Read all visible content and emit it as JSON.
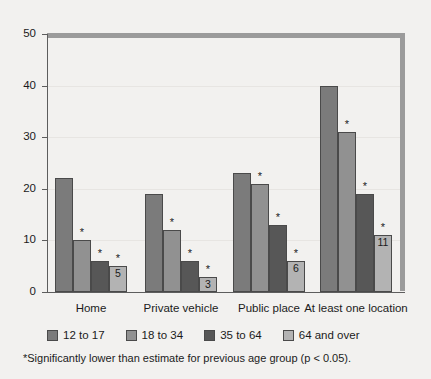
{
  "chart_data": {
    "type": "bar",
    "title": "",
    "subtitle": "",
    "xlabel": "",
    "ylabel": "",
    "ylim": [
      0,
      50
    ],
    "yticks": [
      0,
      10,
      20,
      30,
      40,
      50
    ],
    "ytick_labels": [
      "0",
      "10",
      "20",
      "30",
      "40",
      "50"
    ],
    "grid": true,
    "legend_position": "bottom",
    "categories": [
      "Home",
      "Private vehicle",
      "Public place",
      "At least one location"
    ],
    "series": [
      {
        "name": "12 to 17",
        "color": "#7b7b7b",
        "values": [
          22,
          19,
          23,
          40
        ]
      },
      {
        "name": "18 to 34",
        "color": "#919191",
        "values": [
          10,
          12,
          21,
          31
        ]
      },
      {
        "name": "35 to 64",
        "color": "#575757",
        "values": [
          6,
          6,
          13,
          19
        ]
      },
      {
        "name": "64 and over",
        "color": "#b3b3b3",
        "values": [
          5,
          3,
          6,
          11
        ]
      }
    ],
    "significance_markers": [
      {
        "category": "Home",
        "series": "18 to 34",
        "marker": "*"
      },
      {
        "category": "Home",
        "series": "35 to 64",
        "marker": "*"
      },
      {
        "category": "Home",
        "series": "64 and over",
        "marker": "*"
      },
      {
        "category": "Private vehicle",
        "series": "18 to 34",
        "marker": "*"
      },
      {
        "category": "Private vehicle",
        "series": "35 to 64",
        "marker": "*"
      },
      {
        "category": "Private vehicle",
        "series": "64 and over",
        "marker": "*"
      },
      {
        "category": "Public place",
        "series": "18 to 34",
        "marker": "*"
      },
      {
        "category": "Public place",
        "series": "35 to 64",
        "marker": "*"
      },
      {
        "category": "Public place",
        "series": "64 and over",
        "marker": "*"
      },
      {
        "category": "At least one location",
        "series": "18 to 34",
        "marker": "*"
      },
      {
        "category": "At least one location",
        "series": "35 to 64",
        "marker": "*"
      },
      {
        "category": "At least one location",
        "series": "64 and over",
        "marker": "*"
      }
    ],
    "data_labels": [
      {
        "category": "Home",
        "series": "64 and over",
        "text": "5"
      },
      {
        "category": "Private vehicle",
        "series": "64 and over",
        "text": "3"
      },
      {
        "category": "Public place",
        "series": "64 and over",
        "text": "6"
      },
      {
        "category": "At least one location",
        "series": "64 and over",
        "text": "11"
      }
    ],
    "annotations": [
      "*Significantly lower than estimate for previous age group (p < 0.05)."
    ]
  },
  "axis": {
    "y": {
      "labels": [
        "50",
        "40",
        "30",
        "20",
        "10",
        "0"
      ],
      "values": [
        50,
        40,
        30,
        20,
        10,
        0
      ]
    },
    "x": {
      "labels": [
        "Home",
        "Private vehicle",
        "Public place",
        "At least one location"
      ]
    }
  },
  "legend": {
    "items": [
      {
        "label": "12 to 17",
        "color": "#7b7b7b"
      },
      {
        "label": "18 to 34",
        "color": "#919191"
      },
      {
        "label": "35 to 64",
        "color": "#575757"
      },
      {
        "label": "64 and over",
        "color": "#b3b3b3"
      }
    ]
  },
  "footnote": {
    "text": "*Significantly lower than estimate for previous age group (p < 0.05)."
  },
  "colors": {
    "background": "#f2f1ef",
    "frame": "#9b9b9b",
    "axis": "#5d5d5d",
    "gridline": "#e7e5e2",
    "text": "#1b1b1b"
  }
}
